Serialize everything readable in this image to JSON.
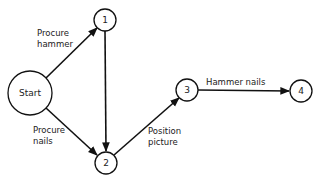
{
  "diagram": {
    "type": "activity network (PERT)",
    "nodes": [
      {
        "id": "start",
        "label": "Start",
        "cx": 30,
        "cy": 93,
        "r": 22
      },
      {
        "id": "n1",
        "label": "1",
        "cx": 105,
        "cy": 20,
        "r": 11
      },
      {
        "id": "n2",
        "label": "2",
        "cx": 106,
        "cy": 163,
        "r": 11
      },
      {
        "id": "n3",
        "label": "3",
        "cx": 187,
        "cy": 90,
        "r": 11
      },
      {
        "id": "n4",
        "label": "4",
        "cx": 301,
        "cy": 91,
        "r": 11
      }
    ],
    "edges": [
      {
        "from": "start",
        "to": "n1",
        "label_lines": [
          "Procure",
          "hammer"
        ]
      },
      {
        "from": "n1",
        "to": "n2",
        "label_lines": []
      },
      {
        "from": "start",
        "to": "n2",
        "label_lines": [
          "Procure",
          "nails"
        ]
      },
      {
        "from": "n2",
        "to": "n3",
        "label_lines": [
          "Position",
          "picture"
        ]
      },
      {
        "from": "n3",
        "to": "n4",
        "label_lines": [
          "Hammer nails"
        ]
      }
    ]
  },
  "labels": {
    "start": "Start",
    "n1": "1",
    "n2": "2",
    "n3": "3",
    "n4": "4",
    "procure_hammer_1": "Procure",
    "procure_hammer_2": "hammer",
    "procure_nails_1": "Procure",
    "procure_nails_2": "nails",
    "position_picture_1": "Position",
    "position_picture_2": "picture",
    "hammer_nails": "Hammer nails"
  }
}
